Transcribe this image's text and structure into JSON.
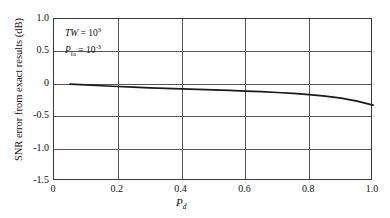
{
  "chart_data": {
    "type": "line",
    "title": "",
    "xlabel": "P_d",
    "xlabel_base": "P",
    "xlabel_sub": "d",
    "ylabel": "SNR error from exact results (dB)",
    "xlim": [
      0.0,
      1.0
    ],
    "ylim": [
      -1.5,
      1.0
    ],
    "xticks": [
      "0",
      "0.2",
      "0.4",
      "0.6",
      "0.8",
      "1.0"
    ],
    "xtick_values": [
      0.0,
      0.2,
      0.4,
      0.6,
      0.8,
      1.0
    ],
    "yticks": [
      "1.0",
      "0.5",
      "0",
      "-0.5",
      "-1.0",
      "-1.5"
    ],
    "ytick_values": [
      1.0,
      0.5,
      0.0,
      -0.5,
      -1.0,
      -1.5
    ],
    "grid": true,
    "legend": "none",
    "line_color": "#1a1a1a",
    "grid_color": "#555555",
    "frame_color": "#3a3a3a",
    "series": [
      {
        "name": "SNR error",
        "x": [
          0.05,
          0.1,
          0.15,
          0.2,
          0.25,
          0.3,
          0.35,
          0.4,
          0.45,
          0.5,
          0.55,
          0.6,
          0.65,
          0.7,
          0.75,
          0.8,
          0.85,
          0.9,
          0.95,
          1.0
        ],
        "values": [
          -0.005,
          -0.018,
          -0.03,
          -0.042,
          -0.052,
          -0.062,
          -0.071,
          -0.079,
          -0.087,
          -0.095,
          -0.103,
          -0.112,
          -0.122,
          -0.134,
          -0.148,
          -0.166,
          -0.19,
          -0.222,
          -0.268,
          -0.33
        ]
      }
    ],
    "annotations": [
      {
        "id": "tw",
        "base": "TW",
        "eq": " = ",
        "mantissa": "10",
        "exponent": "3",
        "text": "TW = 10^3"
      },
      {
        "id": "pfa",
        "base": "P",
        "subscript": "fa",
        "eq": " = ",
        "mantissa": "10",
        "exponent": "-3",
        "text": "P_fa = 10^-3"
      }
    ]
  }
}
